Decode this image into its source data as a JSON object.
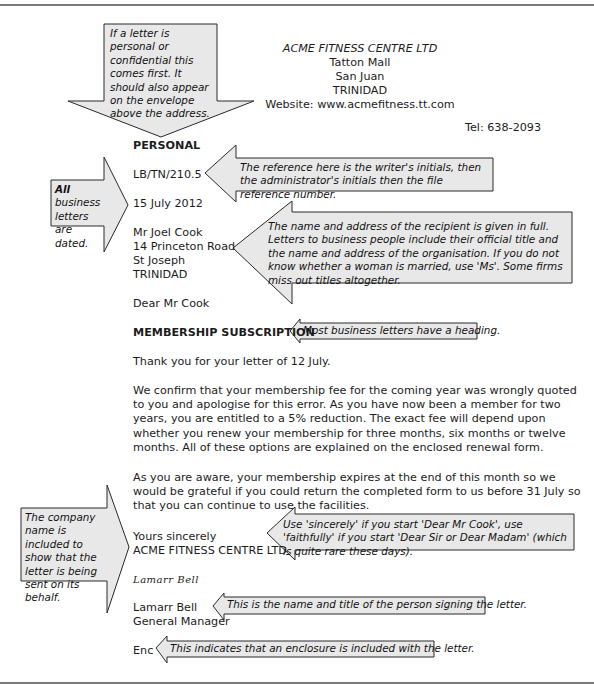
{
  "letterhead": {
    "company": "ACME FITNESS CENTRE LTD",
    "address_lines": [
      "Tatton Mall",
      "San Juan",
      "TRINIDAD"
    ],
    "website": "Website: www.acmefitness.tt.com",
    "tel": "Tel: 638-2093"
  },
  "letter": {
    "marking": "PERSONAL",
    "reference": "LB/TN/210.5",
    "date": "15 July 2012",
    "recipient": [
      "Mr Joel Cook",
      "14 Princeton Road",
      "St Joseph",
      "TRINIDAD"
    ],
    "salutation": "Dear Mr Cook",
    "heading": "MEMBERSHIP SUBSCRIPTION",
    "paragraphs": [
      "Thank you for your letter of 12 July.",
      "We confirm that your membership fee for the coming year was wrongly quoted to you and apologise for this error. As you have now been a member for two years, you are entitled to a 5% reduction. The exact fee will depend upon whether you renew your membership for three months, six months or twelve months. All of these options are explained on the enclosed renewal form.",
      "As you are aware, your membership expires at the end of this month so we would be grateful if you could return the completed form to us before 31 July so that you can continue to use the facilities."
    ],
    "closing": "Yours sincerely",
    "closing_company": "ACME FITNESS CENTRE LTD",
    "signature": "Lamarr Bell",
    "signer_name": "Lamarr Bell",
    "signer_title": "General Manager",
    "enclosure": "Enc"
  },
  "annotations": {
    "personal": "If a letter is personal or confidential this comes first. It should also appear on the envelope above the address.",
    "dated_bold": "All",
    "dated_rest": " business letters are dated.",
    "reference": "The reference here is the writer's initials, then the administrator's initials then the file reference number.",
    "recipient": "The name and address of the recipient is given in full. Letters to business people include their official title and the name and address of the organisation. If you do not know whether a woman is married, use 'Ms'. Some firms miss out titles altogether.",
    "heading": "Most business letters have a heading.",
    "company_name": "The company name is included to show that the letter is being sent on its behalf.",
    "closing": "Use 'sincerely' if you start 'Dear Mr Cook', use 'faithfully' if you start 'Dear Sir or Dear Madam' (which is quite rare these days).",
    "signer": "This is the name and title of the person signing the letter.",
    "enclosure": "This indicates that an enclosure is included with the letter."
  },
  "colors": {
    "callout_fill": "#e8e8e8",
    "callout_stroke": "#2a2a2a",
    "rule": "#7a7a7a"
  }
}
